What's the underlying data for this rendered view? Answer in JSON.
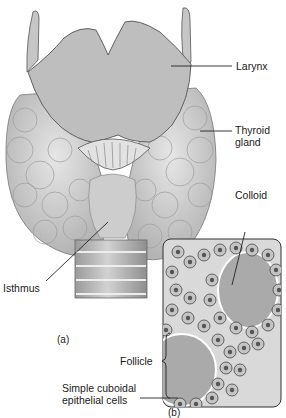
{
  "figure": {
    "panels": {
      "a": "(a)",
      "b": "(b)"
    },
    "labels": {
      "larynx": "Larynx",
      "thyroid_gland_line1": "Thyroid",
      "thyroid_gland_line2": "gland",
      "colloid": "Colloid",
      "isthmus": "Isthmus",
      "follicle": "Follicle",
      "cuboidal_line1": "Simple cuboidal",
      "cuboidal_line2": "epithelial cells"
    },
    "colors": {
      "larynx_fill": "#b9b9b9",
      "lobe_fill": "#d6d6d6",
      "lobe_shadow": "#a8a8a8",
      "trachea_fill": "#bcbcbc",
      "colloid_fill": "#a9a9a9",
      "cell_fill": "#c4c4c4",
      "nucleus_fill": "#555555",
      "line": "#222222"
    }
  }
}
